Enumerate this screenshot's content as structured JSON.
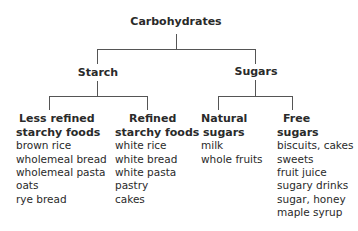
{
  "root": {
    "label": "Carbohydrates"
  },
  "branches": [
    {
      "label": "Starch",
      "children": [
        {
          "title_lines": [
            "Less refined",
            "starchy foods"
          ],
          "items": [
            "brown rice",
            "wholemeal bread",
            "wholemeal pasta",
            "oats",
            "rye bread"
          ]
        },
        {
          "title_lines": [
            "Refined",
            "starchy foods"
          ],
          "items": [
            "white rice",
            "white bread",
            "white pasta",
            "pastry",
            "cakes"
          ]
        }
      ]
    },
    {
      "label": "Sugars",
      "children": [
        {
          "title_lines": [
            "Natural",
            "sugars"
          ],
          "items": [
            "milk",
            "whole fruits"
          ]
        },
        {
          "title_lines": [
            "Free",
            "sugars"
          ],
          "items": [
            "biscuits, cakes",
            "sweets",
            "fruit juice",
            "sugary drinks",
            "sugar, honey",
            "maple syrup"
          ]
        }
      ]
    }
  ]
}
